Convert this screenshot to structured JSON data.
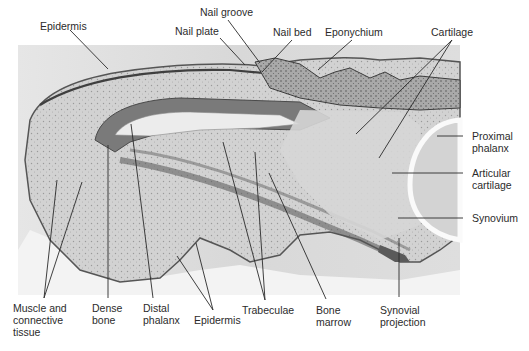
{
  "figure": {
    "background_color": "#ffffff",
    "photo_background": "#dcdcdc"
  },
  "labels": {
    "top": [
      {
        "id": "epidermis-top",
        "text": "Epidermis"
      },
      {
        "id": "nail-groove",
        "text": "Nail groove"
      },
      {
        "id": "nail-plate",
        "text": "Nail plate"
      },
      {
        "id": "nail-bed",
        "text": "Nail bed"
      },
      {
        "id": "eponychium",
        "text": "Eponychium"
      },
      {
        "id": "cartilage",
        "text": "Cartilage"
      }
    ],
    "right": [
      {
        "id": "proximal-phalanx",
        "text": "Proximal\nphalanx"
      },
      {
        "id": "articular-cartilage",
        "text": "Articular\ncartilage"
      },
      {
        "id": "synovium",
        "text": "Synovium"
      }
    ],
    "bottom": [
      {
        "id": "muscle-connective",
        "text": "Muscle and\nconnective\ntissue"
      },
      {
        "id": "dense-bone",
        "text": "Dense\nbone"
      },
      {
        "id": "distal-phalanx",
        "text": "Distal\nphalanx"
      },
      {
        "id": "epidermis-bottom",
        "text": "Epidermis"
      },
      {
        "id": "trabeculae",
        "text": "Trabeculae"
      },
      {
        "id": "bone-marrow",
        "text": "Bone\nmarrow"
      },
      {
        "id": "synovial-projection",
        "text": "Synovial\nprojection"
      }
    ]
  }
}
